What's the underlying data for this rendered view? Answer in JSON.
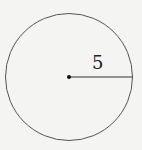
{
  "diagram": {
    "shape": "circle",
    "radius_label": "5",
    "colors": {
      "stroke": "#444444",
      "background": "#f4f4f2"
    }
  }
}
